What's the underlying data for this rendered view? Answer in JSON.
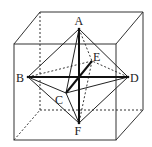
{
  "figure": {
    "stroke_color": "#333333",
    "background": "#ffffff"
  },
  "cube": {
    "front_face": {
      "tl": [
        14,
        44
      ],
      "tr": [
        116,
        44
      ],
      "br": [
        116,
        140
      ],
      "bl": [
        14,
        140
      ]
    },
    "back_face": {
      "tl": [
        40,
        12
      ],
      "tr": [
        143,
        12
      ],
      "br": [
        143,
        110
      ],
      "bl": [
        40,
        110
      ]
    },
    "hidden_edges": [
      "back_tl-back_bl",
      "back_bl-back_br",
      "front_bl-back_bl"
    ]
  },
  "vertices": {
    "A": {
      "label": "A",
      "x": 79,
      "y": 29
    },
    "B": {
      "label": "B",
      "x": 28,
      "y": 77
    },
    "C": {
      "label": "C",
      "x": 66,
      "y": 93
    },
    "D": {
      "label": "D",
      "x": 128,
      "y": 77
    },
    "E": {
      "label": "E",
      "x": 92,
      "y": 61
    },
    "F": {
      "label": "F",
      "x": 79,
      "y": 123
    }
  },
  "edges": {
    "solid": [
      "AB",
      "AC",
      "AD",
      "BC",
      "CD",
      "BF",
      "CF",
      "DF"
    ],
    "dashed": [
      "AE",
      "BE",
      "DE",
      "EF"
    ],
    "diagonals_bold": [
      "BD",
      "AF",
      "CE"
    ]
  },
  "labels": {
    "A": "A",
    "B": "B",
    "C": "C",
    "D": "D",
    "E": "E",
    "F": "F"
  }
}
